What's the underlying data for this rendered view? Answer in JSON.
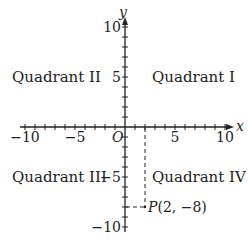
{
  "diagram": {
    "type": "coordinate-plane",
    "axes": {
      "x_label": "x",
      "y_label": "y",
      "origin_label": "O",
      "range": [
        -10,
        10
      ],
      "tick_step": 1,
      "labeled_ticks": {
        "x": [
          {
            "value": -10,
            "label": "−10"
          },
          {
            "value": -5,
            "label": "−5"
          },
          {
            "value": 5,
            "label": "5"
          },
          {
            "value": 10,
            "label": "10"
          }
        ],
        "y": [
          {
            "value": 10,
            "label": "10"
          },
          {
            "value": 5,
            "label": "5"
          },
          {
            "value": -5,
            "label": "−5"
          },
          {
            "value": -10,
            "label": "−10"
          }
        ]
      }
    },
    "quadrants": {
      "q1": "Quadrant I",
      "q2": "Quadrant II",
      "q3": "Quadrant III",
      "q4": "Quadrant IV"
    },
    "point": {
      "name": "P",
      "coords_label": "(2, −8)",
      "x": 2,
      "y": -8
    },
    "colors": {
      "axis": "#222222",
      "text": "#222222",
      "background": "#ffffff"
    }
  }
}
